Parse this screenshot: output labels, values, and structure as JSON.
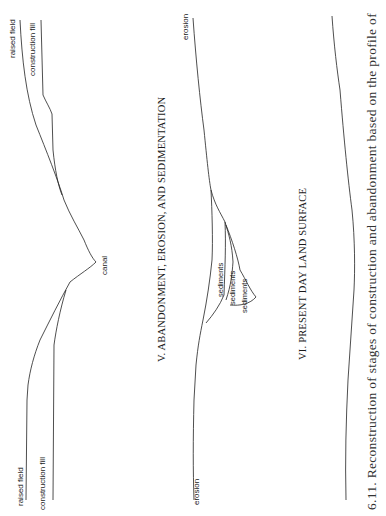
{
  "figure": {
    "caption": "6.11. Reconstruction of stages of construction and abandonment based on the profile of",
    "orientation": "rotated 90° counter-clockwise",
    "panels": [
      {
        "id": "profile-raised-field",
        "labels": {
          "raised_field_top": "raised field",
          "construction_fill_top": "construction fill",
          "canal": "canal",
          "raised_field_bottom": "raised field",
          "construction_fill_bottom": "construction fill"
        }
      },
      {
        "id": "stage-v",
        "title": "V.  ABANDONMENT, EROSION, AND SEDIMENTATION",
        "labels": {
          "erosion_top": "erosion",
          "erosion_bottom": "erosion",
          "sediments_1": "sediments",
          "sediments_2": "sediments",
          "sediments_3": "sediments"
        }
      },
      {
        "id": "stage-vi",
        "title": "VI.  PRESENT DAY LAND SURFACE"
      }
    ]
  }
}
